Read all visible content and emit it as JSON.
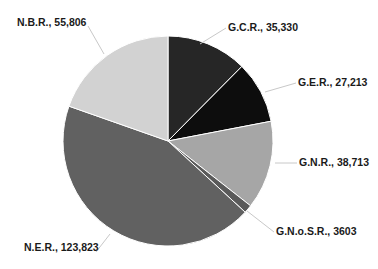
{
  "chart_data": {
    "type": "pie",
    "title": "",
    "start_angle_deg": 0,
    "direction": "clockwise",
    "center": [
      168,
      141
    ],
    "radius": 105,
    "slices": [
      {
        "name": "G.C.R.",
        "value": 35330,
        "label": "G.C.R., 35,330",
        "color": "#262626",
        "label_pos": [
          228,
          31
        ],
        "leader": [
          [
            200,
            44
          ],
          [
            226,
            28
          ]
        ]
      },
      {
        "name": "G.E.R.",
        "value": 27213,
        "label": "G.E.R., 27,213",
        "color": "#0d0d0d",
        "label_pos": [
          298,
          86
        ],
        "leader": [
          [
            265,
            92
          ],
          [
            296,
            83
          ]
        ]
      },
      {
        "name": "G.N.R.",
        "value": 38713,
        "label": "G.N.R., 38,713",
        "color": "#a6a6a6",
        "label_pos": [
          299,
          166
        ],
        "leader": [
          [
            275,
            163
          ],
          [
            297,
            163
          ]
        ]
      },
      {
        "name": "G.N.o.S.R.",
        "value": 3603,
        "label": "G.N.o.S.R., 3603",
        "color": "#5a5a5a",
        "label_pos": [
          276,
          235
        ],
        "leader": [
          [
            247,
            211
          ],
          [
            274,
            232
          ]
        ]
      },
      {
        "name": "N.E.R.",
        "value": 123823,
        "label": "N.E.R., 123,823",
        "color": "#616161",
        "label_pos": [
          24,
          251
        ],
        "leader": [
          [
            110,
            234
          ],
          [
            96,
            252
          ]
        ]
      },
      {
        "name": "N.B.R.",
        "value": 55806,
        "label": "N.B.R., 55,806",
        "color": "#d2d2d2",
        "label_pos": [
          17,
          26
        ],
        "leader": [
          [
            104,
            54
          ],
          [
            88,
            26
          ]
        ]
      }
    ],
    "legend": null
  }
}
